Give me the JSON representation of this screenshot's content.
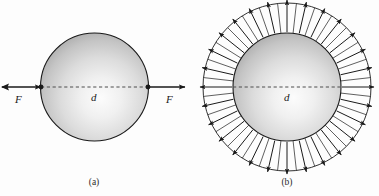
{
  "figure": {
    "background_color": "#fdfdfd",
    "ink_color": "#1a1a1a",
    "width": 379,
    "height": 196
  },
  "panels": [
    {
      "id": "a",
      "caption": "(a)",
      "description": "Sphere loaded by two opposed point forces F along a horizontal diameter",
      "center": {
        "x": 94.5,
        "y": 87
      },
      "sphere_radius": 54,
      "diameter_label": "d",
      "force_label_left": "F",
      "force_label_right": "F",
      "arrow_count": 2,
      "arrow_direction": "inward-horizontal"
    },
    {
      "id": "b",
      "caption": "(b)",
      "description": "Sphere with uniformly distributed radial outward arrows around its circumference",
      "center": {
        "x": 287,
        "y": 87
      },
      "sphere_radius": 54,
      "outer_radius": 84,
      "diameter_label": "d",
      "arrow_count": 28,
      "arrow_direction": "radial-outward"
    }
  ],
  "labels": {
    "force_left": "F",
    "force_right": "F",
    "diameter_a": "d",
    "diameter_b": "d",
    "caption_a": "(a)",
    "caption_b": "(b)"
  },
  "colors": {
    "sphere_light": "#fbfbfb",
    "sphere_mid": "#d2d2d2",
    "sphere_dark": "#9a9a9a",
    "outline": "#1a1a1a",
    "dashed": "#5a5a5a",
    "background": "#fdfdfd"
  },
  "chart_data": {
    "type": "diagram",
    "panels": [
      "(a)",
      "(b)"
    ],
    "annotations": [
      "F",
      "d",
      "F",
      "d"
    ]
  }
}
